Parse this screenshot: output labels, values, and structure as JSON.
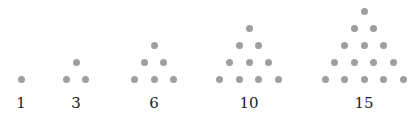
{
  "diagram": {
    "dot_color": "#9e9e9e",
    "groups": [
      {
        "label": "1",
        "rows": 1,
        "center_x": 21
      },
      {
        "label": "3",
        "rows": 2,
        "center_x": 76
      },
      {
        "label": "6",
        "rows": 3,
        "center_x": 154
      },
      {
        "label": "10",
        "rows": 4,
        "center_x": 249
      },
      {
        "label": "15",
        "rows": 5,
        "center_x": 364
      }
    ],
    "bottom_row_y": 79,
    "row_spacing": 17,
    "dot_spacing": 19.5
  }
}
